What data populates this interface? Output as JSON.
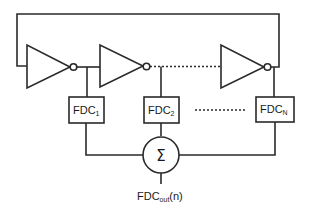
{
  "diagram": {
    "title": "",
    "inverters": [
      {
        "id": "inv-1"
      },
      {
        "id": "inv-2"
      },
      {
        "id": "inv-N"
      }
    ],
    "fdc_blocks": [
      {
        "base": "FDC",
        "sub": "1"
      },
      {
        "base": "FDC",
        "sub": "2"
      },
      {
        "base": "FDC",
        "sub": "N"
      }
    ],
    "summer": {
      "symbol": "Σ"
    },
    "output": {
      "base": "FDC",
      "sub": "out",
      "suffix": "(n)"
    },
    "colors": {
      "line": "#2a2a2a",
      "background": "#ffffff"
    }
  }
}
